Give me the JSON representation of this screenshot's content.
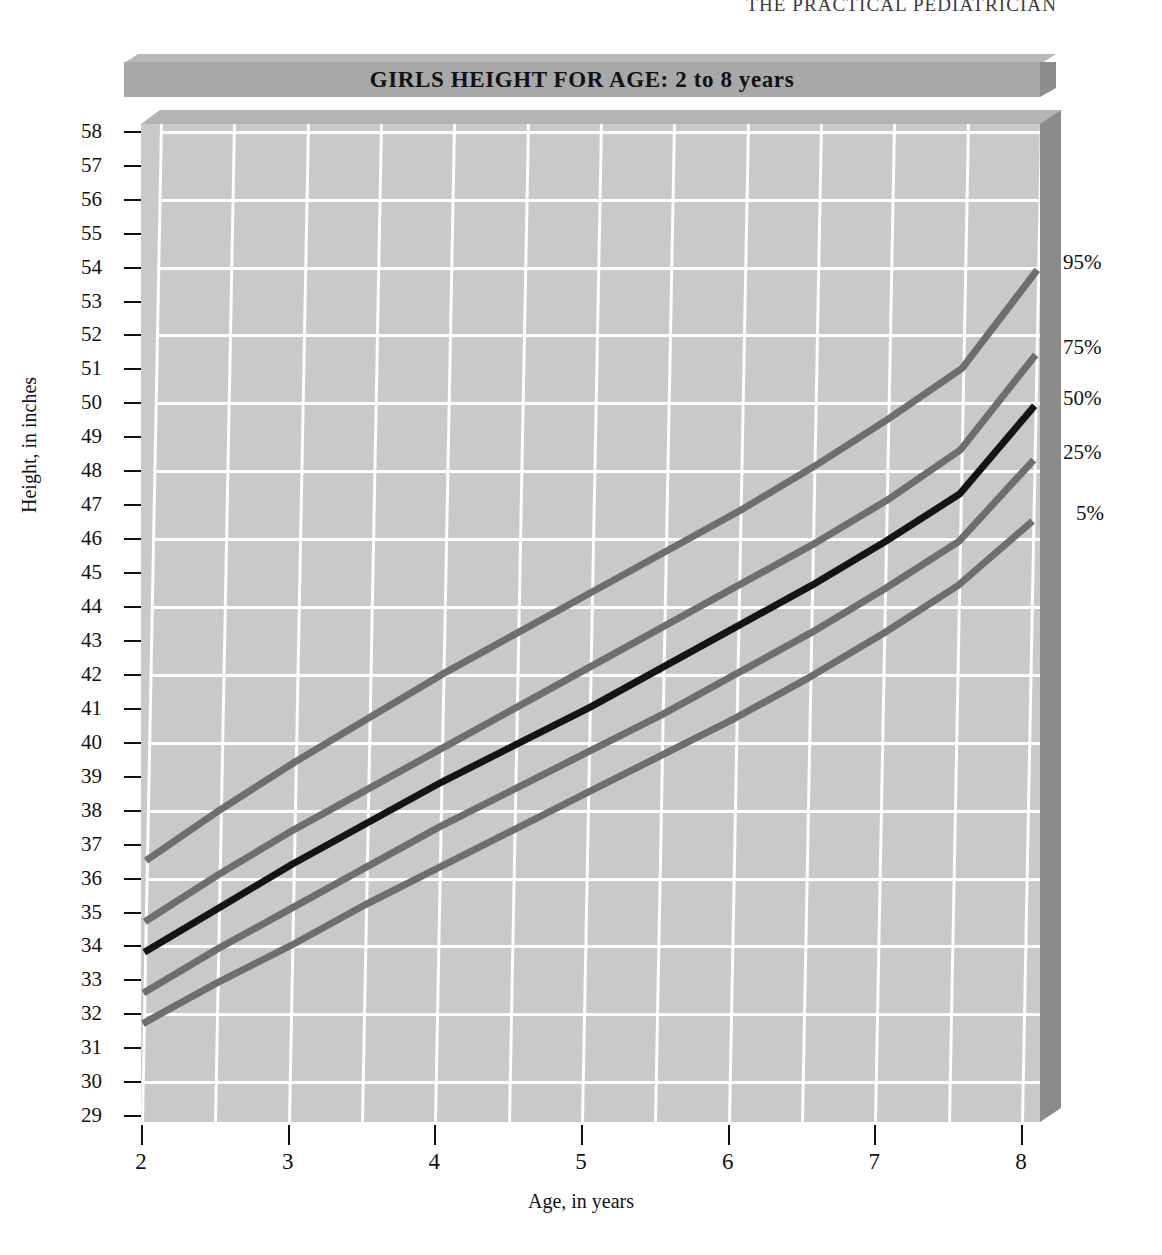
{
  "page": {
    "running_header": "THE PRACTICAL PEDIATRICIAN"
  },
  "chart": {
    "title": "GIRLS HEIGHT FOR AGE: 2 to 8 years",
    "xlabel": "Age, in years",
    "ylabel": "Height, in inches"
  },
  "colors": {
    "plot_face": "#c9c9c9",
    "plot_top_bevel": "#b4b4b4",
    "plot_right_side": "#8a8a8a",
    "gridline": "#fdfdfd",
    "title_face": "#a8a8a8",
    "title_top": "#b9b9b9",
    "title_side": "#8d8d8d",
    "curve_gray": "#6e6e6e",
    "curve_median": "#141414",
    "text": "#111111"
  },
  "chart_data": {
    "type": "line",
    "title": "GIRLS HEIGHT FOR AGE: 2 to 8 years",
    "subtitle": "",
    "xlabel": "Age, in years",
    "ylabel": "Height, in inches",
    "xlim": [
      2,
      8
    ],
    "ylim": [
      28.8,
      58.2
    ],
    "grid": true,
    "grid_x_step": 0.5,
    "grid_y_step": 2,
    "legend_position": "right-of-curve-ends",
    "x_tick_labels": [
      "2",
      "3",
      "4",
      "5",
      "6",
      "7",
      "8"
    ],
    "x_ticks": [
      2,
      3,
      4,
      5,
      6,
      7,
      8
    ],
    "y_ticks": [
      29,
      30,
      31,
      32,
      33,
      34,
      35,
      36,
      37,
      38,
      39,
      40,
      41,
      42,
      43,
      44,
      45,
      46,
      47,
      48,
      49,
      50,
      51,
      52,
      53,
      54,
      55,
      56,
      57,
      58
    ],
    "y_tick_labels": [
      "29",
      "30",
      "31",
      "32",
      "33",
      "34",
      "35",
      "36",
      "37",
      "38",
      "39",
      "40",
      "41",
      "42",
      "43",
      "44",
      "45",
      "46",
      "47",
      "48",
      "49",
      "50",
      "51",
      "52",
      "53",
      "54",
      "55",
      "56",
      "57",
      "58"
    ],
    "x": [
      2,
      2.5,
      3,
      3.5,
      4,
      4.5,
      5,
      5.5,
      6,
      6.5,
      7,
      7.5,
      8
    ],
    "series": [
      {
        "name": "95%",
        "label": "95%",
        "color": "#6e6e6e",
        "width": 7,
        "values": [
          36.5,
          38.0,
          39.4,
          40.7,
          42.0,
          43.2,
          44.4,
          45.6,
          46.8,
          48.1,
          49.5,
          51.0,
          53.9
        ]
      },
      {
        "name": "75%",
        "label": "75%",
        "color": "#6e6e6e",
        "width": 7,
        "values": [
          34.7,
          36.1,
          37.4,
          38.6,
          39.8,
          41.0,
          42.2,
          43.4,
          44.6,
          45.8,
          47.1,
          48.6,
          51.4
        ]
      },
      {
        "name": "50%",
        "label": "50%",
        "color": "#141414",
        "width": 7,
        "values": [
          33.8,
          35.1,
          36.4,
          37.6,
          38.8,
          39.9,
          41.0,
          42.2,
          43.4,
          44.6,
          45.9,
          47.3,
          49.9
        ]
      },
      {
        "name": "25%",
        "label": "25%",
        "color": "#6e6e6e",
        "width": 7,
        "values": [
          32.6,
          33.9,
          35.1,
          36.3,
          37.5,
          38.6,
          39.7,
          40.8,
          42.0,
          43.2,
          44.5,
          45.9,
          48.3
        ]
      },
      {
        "name": "5%",
        "label": "5%",
        "color": "#6e6e6e",
        "width": 7,
        "values": [
          31.7,
          32.9,
          34.0,
          35.2,
          36.3,
          37.4,
          38.5,
          39.6,
          40.7,
          41.9,
          43.2,
          44.6,
          46.5
        ]
      }
    ],
    "percentile_labels": [
      {
        "text": "95%",
        "y_value": 54.1
      },
      {
        "text": "75%",
        "y_value": 51.6
      },
      {
        "text": "50%",
        "y_value": 50.1
      },
      {
        "text": "25%",
        "y_value": 48.5
      },
      {
        "text": "5%",
        "y_value": 46.7
      }
    ]
  }
}
